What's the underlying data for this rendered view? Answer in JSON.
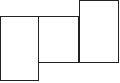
{
  "diagram": {
    "stroke_color": "#222222",
    "fill_color": "#ffffff",
    "shapes": [
      {
        "name": "rect-left",
        "x": 0,
        "y": 16,
        "w": 39,
        "h": 65
      },
      {
        "name": "rect-middle",
        "x": 38,
        "y": 16,
        "w": 41,
        "h": 47
      },
      {
        "name": "rect-right",
        "x": 79,
        "y": 0,
        "w": 40,
        "h": 63
      }
    ]
  }
}
